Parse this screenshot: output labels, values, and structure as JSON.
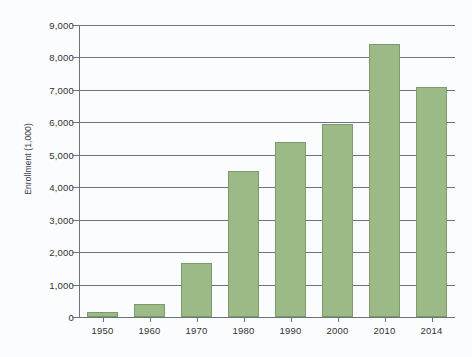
{
  "chart_data": {
    "type": "bar",
    "title": "",
    "subtitle": "",
    "xlabel": "",
    "ylabel": "Enrollment (1,000)",
    "categories": [
      "1950",
      "1960",
      "1970",
      "1980",
      "1990",
      "2000",
      "2010",
      "2014"
    ],
    "values": [
      150,
      400,
      1650,
      4500,
      5400,
      5950,
      8400,
      7100
    ],
    "series": [
      {
        "name": "Enrollment",
        "values": [
          150,
          400,
          1650,
          4500,
          5400,
          5950,
          8400,
          7100
        ]
      }
    ],
    "ylim": [
      0,
      9000
    ],
    "ytick_step": 1000,
    "ytick_labels": [
      "0",
      "1,000",
      "2,000",
      "3,000",
      "4,000",
      "5,000",
      "6,000",
      "7,000",
      "8,000",
      "9,000"
    ],
    "ytick_values": [
      0,
      1000,
      2000,
      3000,
      4000,
      5000,
      6000,
      7000,
      8000,
      9000
    ],
    "grid": true,
    "grid_axis": "y",
    "legend": false,
    "legend_position": "none",
    "bar_color": "#9cba88",
    "bar_border_color": "#7b9c6a",
    "axis_color": "#6d7378",
    "text_color": "#2f3236",
    "background_color": "#fbfcfe"
  }
}
